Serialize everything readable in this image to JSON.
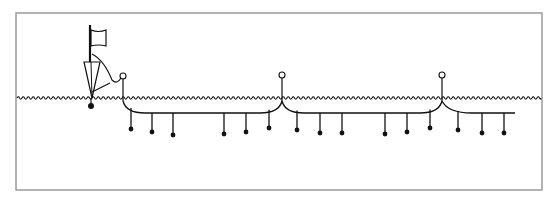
{
  "diagram": {
    "title": "",
    "frame": {
      "x": 16,
      "y": 13,
      "w": 526,
      "h": 177,
      "stroke": "#9a9a9a"
    },
    "colors": {
      "line": "#111111",
      "frame": "#9a9a9a",
      "float_fill": "#ffffff",
      "weight_fill": "#111111"
    },
    "water": {
      "y": 98,
      "x_start": 17,
      "x_end": 541,
      "wave_period": 5,
      "wave_amp": 1.2
    },
    "flag_buoy": {
      "pole_x": 90,
      "pole_top": 25,
      "pole_bottom": 62,
      "flag": {
        "x1": 91,
        "y1": 30,
        "x2": 106,
        "y2": 46
      },
      "float_triangle": {
        "left_x": 84,
        "right_x": 100,
        "top_y": 62,
        "apex_x": 92,
        "apex_y": 98
      },
      "weight": {
        "cx": 91,
        "cy": 106,
        "r": 3
      },
      "tether_end": {
        "cx": 123,
        "cy": 76,
        "r": 3
      }
    },
    "mainline": {
      "start_x": 123,
      "end_x": 515,
      "bottom_y": 113
    },
    "buoys": [
      {
        "name": "buoy-left",
        "cx": 123,
        "cy": 76,
        "r": 3
      },
      {
        "name": "buoy-middle",
        "cx": 282,
        "cy": 75,
        "r": 3
      },
      {
        "name": "buoy-right",
        "cx": 442,
        "cy": 75,
        "r": 3
      }
    ],
    "segments": [
      {
        "from_x": 123,
        "to_x": 282
      },
      {
        "from_x": 282,
        "to_x": 442
      },
      {
        "from_x": 442,
        "to_x": 515
      }
    ],
    "branchlines": [
      {
        "x": 131,
        "dot_y": 129
      },
      {
        "x": 152,
        "dot_y": 132
      },
      {
        "x": 173,
        "dot_y": 135
      },
      {
        "x": 224,
        "dot_y": 134
      },
      {
        "x": 246,
        "dot_y": 132
      },
      {
        "x": 269,
        "dot_y": 128
      },
      {
        "x": 297,
        "dot_y": 130
      },
      {
        "x": 320,
        "dot_y": 133
      },
      {
        "x": 342,
        "dot_y": 133
      },
      {
        "x": 385,
        "dot_y": 134
      },
      {
        "x": 407,
        "dot_y": 132
      },
      {
        "x": 430,
        "dot_y": 128
      },
      {
        "x": 458,
        "dot_y": 130
      },
      {
        "x": 482,
        "dot_y": 133
      },
      {
        "x": 504,
        "dot_y": 133
      }
    ]
  }
}
